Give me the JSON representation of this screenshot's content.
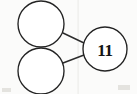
{
  "diagram": {
    "type": "graph",
    "canvas": {
      "width": 137,
      "height": 94,
      "background": "#fbfbfa"
    },
    "style": {
      "stroke_color": "#232323",
      "edge_color": "#2b2b2b",
      "node_fill": "#ffffff",
      "label_color": "#141414"
    },
    "nodes": [
      {
        "id": "node-top-left",
        "name": "top-left-node",
        "label": "",
        "cx": 41,
        "cy": 24,
        "r": 23
      },
      {
        "id": "node-bottom-left",
        "name": "bottom-left-node",
        "label": "",
        "cx": 41,
        "cy": 71,
        "r": 23
      },
      {
        "id": "node-right",
        "name": "labeled-node",
        "label": "11",
        "cx": 105,
        "cy": 49,
        "r": 22
      }
    ],
    "edges": [
      {
        "id": "edge-top",
        "name": "edge-top-left-to-labeled",
        "x1": 63,
        "y1": 33,
        "x2": 84,
        "y2": 43
      },
      {
        "id": "edge-bottom",
        "name": "edge-bottom-left-to-labeled",
        "x1": 63,
        "y1": 63,
        "x2": 84,
        "y2": 55
      }
    ]
  }
}
